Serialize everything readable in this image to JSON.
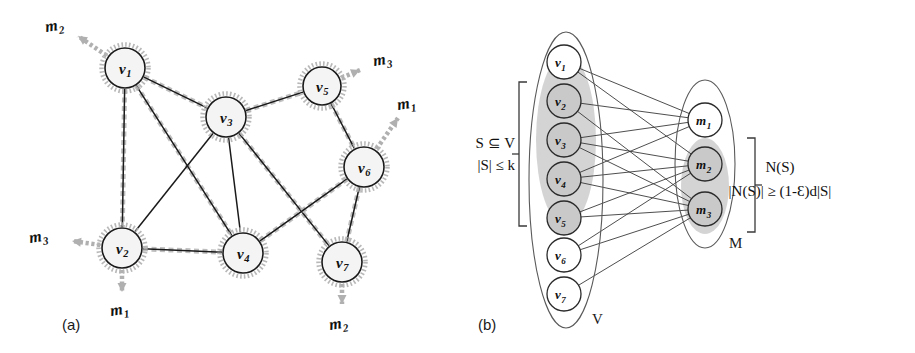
{
  "figure": {
    "panels": [
      {
        "id": "a",
        "caption": "(a)",
        "caption_x": 62,
        "caption_y": 330
      },
      {
        "id": "b",
        "caption": "(b)",
        "caption_x": 478,
        "caption_y": 330
      }
    ]
  },
  "panel_a": {
    "nodes": [
      {
        "id": "v1",
        "label": "v",
        "sub": "1",
        "x": 125,
        "y": 68,
        "r": 20
      },
      {
        "id": "v2",
        "label": "v",
        "sub": "2",
        "x": 122,
        "y": 248,
        "r": 20
      },
      {
        "id": "v3",
        "label": "v",
        "sub": "3",
        "x": 226,
        "y": 117,
        "r": 20
      },
      {
        "id": "v4",
        "label": "v",
        "sub": "4",
        "x": 243,
        "y": 253,
        "r": 20
      },
      {
        "id": "v5",
        "label": "v",
        "sub": "5",
        "x": 322,
        "y": 86,
        "r": 19
      },
      {
        "id": "v6",
        "label": "v",
        "sub": "6",
        "x": 364,
        "y": 167,
        "r": 20
      },
      {
        "id": "v7",
        "label": "v",
        "sub": "7",
        "x": 342,
        "y": 262,
        "r": 20
      }
    ],
    "edges": [
      {
        "from": "v1",
        "to": "v2",
        "highlighted": true
      },
      {
        "from": "v1",
        "to": "v3",
        "highlighted": true
      },
      {
        "from": "v1",
        "to": "v4",
        "highlighted": true
      },
      {
        "from": "v2",
        "to": "v3",
        "highlighted": false
      },
      {
        "from": "v2",
        "to": "v4",
        "highlighted": true
      },
      {
        "from": "v3",
        "to": "v4",
        "highlighted": false
      },
      {
        "from": "v3",
        "to": "v5",
        "highlighted": true
      },
      {
        "from": "v3",
        "to": "v7",
        "highlighted": true
      },
      {
        "from": "v5",
        "to": "v6",
        "highlighted": true
      },
      {
        "from": "v4",
        "to": "v6",
        "highlighted": true
      },
      {
        "from": "v6",
        "to": "v7",
        "highlighted": true
      }
    ],
    "message_stubs": [
      {
        "id": "m2-at-v1",
        "label": "m",
        "sub": "2",
        "from": "v1",
        "tip_x": 78,
        "tip_y": 36,
        "label_x": 46,
        "label_y": 32
      },
      {
        "id": "m3-at-v2",
        "label": "m",
        "sub": "3",
        "from": "v2",
        "tip_x": 72,
        "tip_y": 241,
        "label_x": 30,
        "label_y": 243
      },
      {
        "id": "m1-at-v2",
        "label": "m",
        "sub": "1",
        "from": "v2",
        "tip_x": 122,
        "tip_y": 292,
        "label_x": 111,
        "label_y": 316
      },
      {
        "id": "m3-at-v5",
        "label": "m",
        "sub": "3",
        "from": "v5",
        "tip_x": 360,
        "tip_y": 70,
        "label_x": 374,
        "label_y": 66
      },
      {
        "id": "m1-at-v6",
        "label": "m",
        "sub": "1",
        "from": "v6",
        "tip_x": 398,
        "tip_y": 118,
        "label_x": 398,
        "label_y": 110
      },
      {
        "id": "m2-at-v7",
        "label": "m",
        "sub": "2",
        "from": "v7",
        "tip_x": 342,
        "tip_y": 304,
        "label_x": 330,
        "label_y": 330
      }
    ]
  },
  "panel_b": {
    "left_set": {
      "name": "V",
      "name_x": 592,
      "name_y": 324,
      "ellipse": {
        "cx": 566,
        "cy": 180,
        "rx": 37,
        "ry": 148
      },
      "highlight_blob": {
        "cx": 566,
        "cy": 140,
        "rx": 30,
        "ry": 86
      },
      "nodes": [
        {
          "id": "v1",
          "label": "v",
          "sub": "1",
          "x": 564,
          "y": 62,
          "r": 17,
          "shaded": false
        },
        {
          "id": "v2",
          "label": "v",
          "sub": "2",
          "x": 564,
          "y": 101,
          "r": 17,
          "shaded": true
        },
        {
          "id": "v3",
          "label": "v",
          "sub": "3",
          "x": 564,
          "y": 140,
          "r": 17,
          "shaded": true
        },
        {
          "id": "v4",
          "label": "v",
          "sub": "4",
          "x": 564,
          "y": 179,
          "r": 17,
          "shaded": true
        },
        {
          "id": "v5",
          "label": "v",
          "sub": "5",
          "x": 564,
          "y": 218,
          "r": 17,
          "shaded": true
        },
        {
          "id": "v6",
          "label": "v",
          "sub": "6",
          "x": 564,
          "y": 255,
          "r": 17,
          "shaded": false
        },
        {
          "id": "v7",
          "label": "v",
          "sub": "7",
          "x": 564,
          "y": 294,
          "r": 17,
          "shaded": false
        }
      ]
    },
    "right_set": {
      "name": "M",
      "name_x": 729,
      "name_y": 248,
      "ellipse": {
        "cx": 705,
        "cy": 164,
        "rx": 30,
        "ry": 84
      },
      "highlight_blob": {
        "cx": 705,
        "cy": 186,
        "rx": 24,
        "ry": 48
      },
      "nodes": [
        {
          "id": "m1",
          "label": "m",
          "sub": "1",
          "x": 705,
          "y": 120,
          "r": 17,
          "shaded": false
        },
        {
          "id": "m2",
          "label": "m",
          "sub": "2",
          "x": 705,
          "y": 164,
          "r": 17,
          "shaded": true
        },
        {
          "id": "m3",
          "label": "m",
          "sub": "3",
          "x": 705,
          "y": 209,
          "r": 17,
          "shaded": true
        }
      ]
    },
    "bipartite_edges": [
      {
        "from": "v1",
        "to": "m1"
      },
      {
        "from": "v1",
        "to": "m2"
      },
      {
        "from": "v2",
        "to": "m1"
      },
      {
        "from": "v2",
        "to": "m3"
      },
      {
        "from": "v3",
        "to": "m1"
      },
      {
        "from": "v3",
        "to": "m2"
      },
      {
        "from": "v3",
        "to": "m3"
      },
      {
        "from": "v4",
        "to": "m1"
      },
      {
        "from": "v4",
        "to": "m2"
      },
      {
        "from": "v4",
        "to": "m3"
      },
      {
        "from": "v5",
        "to": "m2"
      },
      {
        "from": "v5",
        "to": "m3"
      },
      {
        "from": "v6",
        "to": "m2"
      },
      {
        "from": "v6",
        "to": "m3"
      },
      {
        "from": "v7",
        "to": "m3"
      }
    ],
    "left_annotation": {
      "line1": "S ⊆ V",
      "line2": "|S| ≤ k",
      "x": 515,
      "y1": 148,
      "y2": 170,
      "bracket": {
        "x": 527,
        "y_top": 82,
        "y_bottom": 226,
        "tick": 8,
        "mid": 154
      }
    },
    "right_annotation": {
      "line1": "N(S)",
      "line2": "|N(S)| ≥ (1-Ɛ)d|S|",
      "x": 780,
      "y1": 172,
      "y2": 196,
      "bracket": {
        "x": 747,
        "y_top": 138,
        "y_bottom": 232,
        "tick": 8,
        "mid": 185
      }
    }
  },
  "colors": {
    "ink": "#111111",
    "node_fill_a": "#f4f4f4",
    "halo_gray": "#b4b4b4",
    "blob_gray": "#cccccc",
    "shaded_node": "#c9c9c9",
    "background": "#ffffff"
  }
}
